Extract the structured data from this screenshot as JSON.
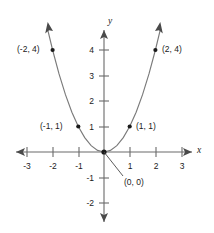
{
  "chart_data": {
    "type": "line",
    "title": "",
    "xlabel": "x",
    "ylabel": "y",
    "function": "y = x^2",
    "xlim": [
      -3.5,
      3.5
    ],
    "ylim": [
      -2.5,
      4.8
    ],
    "grid": false,
    "legend": null,
    "x_ticks": [
      "-3",
      "-2",
      "-1",
      "1",
      "2",
      "3"
    ],
    "x_tick_values": [
      -3,
      -2,
      -1,
      1,
      2,
      3
    ],
    "y_ticks": [
      "4",
      "3",
      "2",
      "1",
      "-1",
      "-2"
    ],
    "y_tick_values": [
      4,
      3,
      2,
      1,
      -1,
      -2
    ],
    "points": [
      {
        "label": "(-2, 4)",
        "x": -2,
        "y": 4
      },
      {
        "label": "(-1, 1)",
        "x": -1,
        "y": 1
      },
      {
        "label": "(0, 0)",
        "x": 0,
        "y": 0
      },
      {
        "label": "(1, 1)",
        "x": 1,
        "y": 1
      },
      {
        "label": "(2, 4)",
        "x": 2,
        "y": 4
      }
    ],
    "series": [
      {
        "name": "parabola",
        "x": [
          -2.2,
          -2.0,
          -1.75,
          -1.5,
          -1.25,
          -1.0,
          -0.75,
          -0.5,
          -0.25,
          0,
          0.25,
          0.5,
          0.75,
          1.0,
          1.25,
          1.5,
          1.75,
          2.0,
          2.2
        ],
        "values": [
          4.84,
          4.0,
          3.0625,
          2.25,
          1.5625,
          1.0,
          0.5625,
          0.25,
          0.0625,
          0,
          0.0625,
          0.25,
          0.5625,
          1.0,
          1.5625,
          2.25,
          3.0625,
          4.0,
          4.84
        ]
      }
    ],
    "colors": {
      "curve": "#7a7a7a",
      "axis": "#6a6a6a",
      "point": "#1a1a1a",
      "text": "#1b1b1b",
      "background": "#ffffff"
    }
  }
}
